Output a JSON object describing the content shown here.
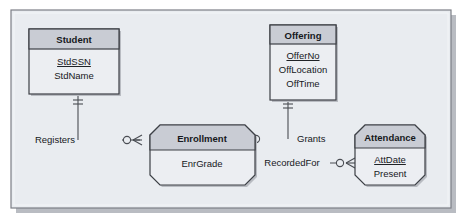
{
  "diagram": {
    "type": "entity-relationship-diagram",
    "notation": "crows-foot",
    "panel_color": "#e9ecf0",
    "frame_color": "#7c7f86",
    "entity_header_fill": "#c9ccd4",
    "entity_body_fill": "#eceef2",
    "entity_border_color": "#3c3f45",
    "line_color": "#4a4d53",
    "entities": [
      {
        "id": "student",
        "name": "Student",
        "kind": "strong",
        "attributes": [
          {
            "name": "StdSSN",
            "key": true
          },
          {
            "name": "StdName",
            "key": false
          }
        ]
      },
      {
        "id": "offering",
        "name": "Offering",
        "kind": "strong",
        "attributes": [
          {
            "name": "OfferNo",
            "key": true
          },
          {
            "name": "OffLocation",
            "key": false
          },
          {
            "name": "OffTime",
            "key": false
          }
        ]
      },
      {
        "id": "enrollment",
        "name": "Enrollment",
        "kind": "weak",
        "attributes": [
          {
            "name": "EnrGrade",
            "key": false
          }
        ]
      },
      {
        "id": "attendance",
        "name": "Attendance",
        "kind": "weak",
        "attributes": [
          {
            "name": "AttDate",
            "key": true
          },
          {
            "name": "Present",
            "key": false
          }
        ]
      }
    ],
    "relationships": [
      {
        "id": "registers",
        "label": "Registers",
        "from": "student",
        "to": "enrollment",
        "from_cardinality": "one-mandatory",
        "to_cardinality": "zero-or-many"
      },
      {
        "id": "grants",
        "label": "Grants",
        "from": "offering",
        "to": "enrollment",
        "from_cardinality": "one-mandatory",
        "to_cardinality": "zero-or-many"
      },
      {
        "id": "recordedfor",
        "label": "RecordedFor",
        "from": "enrollment",
        "to": "attendance",
        "from_cardinality": "one-mandatory",
        "to_cardinality": "zero-or-many"
      }
    ]
  }
}
